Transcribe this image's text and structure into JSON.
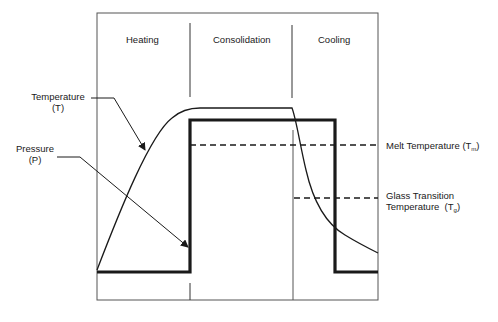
{
  "diagram": {
    "phases": [
      {
        "label": "Heating"
      },
      {
        "label": "Consolidation"
      },
      {
        "label": "Cooling"
      }
    ],
    "curves": {
      "temperature": {
        "label": "Temperature",
        "symbol": "(T)"
      },
      "pressure": {
        "label": "Pressure",
        "symbol": "(P)"
      }
    },
    "thresholds": {
      "melt": {
        "label": "Melt Temperature (T",
        "sub": "m",
        "close": ")"
      },
      "glass": {
        "line1": "Glass Transition",
        "line2": "Temperature  (T",
        "sub": "g",
        "close": ")"
      }
    },
    "colors": {
      "line": "#1a1a1a",
      "frame": "#555555",
      "background": "#ffffff"
    }
  }
}
